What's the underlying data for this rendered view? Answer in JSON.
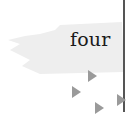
{
  "label": {
    "text": "four"
  },
  "colors": {
    "brush": "#ededed",
    "text": "#1a1a1a",
    "line": "#555555",
    "arrows": "#9a9a9a"
  },
  "arrows": [
    {
      "icon": "triangle-right-icon",
      "x": 88,
      "y": 70
    },
    {
      "icon": "triangle-right-icon",
      "x": 72,
      "y": 86
    },
    {
      "icon": "triangle-right-icon",
      "x": 95,
      "y": 102
    },
    {
      "icon": "triangle-right-icon",
      "x": 117,
      "y": 94
    }
  ]
}
